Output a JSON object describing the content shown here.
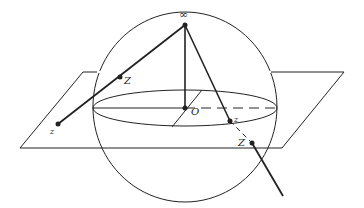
{
  "diagram": {
    "colors": {
      "stroke": "#222222",
      "background": "#ffffff"
    },
    "sphere": {
      "cx": 185,
      "cy": 107,
      "rx": 92,
      "ry": 95
    },
    "equator": {
      "cx": 185,
      "cy": 108,
      "rx": 92,
      "ry": 18
    },
    "plane": {
      "points": "20,148 83,72 344,72 282,148"
    },
    "labels": {
      "infinity": "∞",
      "origin": "O",
      "left_sphere_point": "Z",
      "left_plane_point": "z",
      "right_plane_point": "z",
      "right_sphere_point": "Z"
    },
    "points": {
      "north_pole": {
        "x": 185,
        "y": 25
      },
      "origin": {
        "x": 185,
        "y": 108
      },
      "left_Z": {
        "x": 120,
        "y": 77
      },
      "left_z": {
        "x": 58,
        "y": 124
      },
      "right_z": {
        "x": 230,
        "y": 121
      },
      "right_Z": {
        "x": 252,
        "y": 143
      }
    }
  }
}
